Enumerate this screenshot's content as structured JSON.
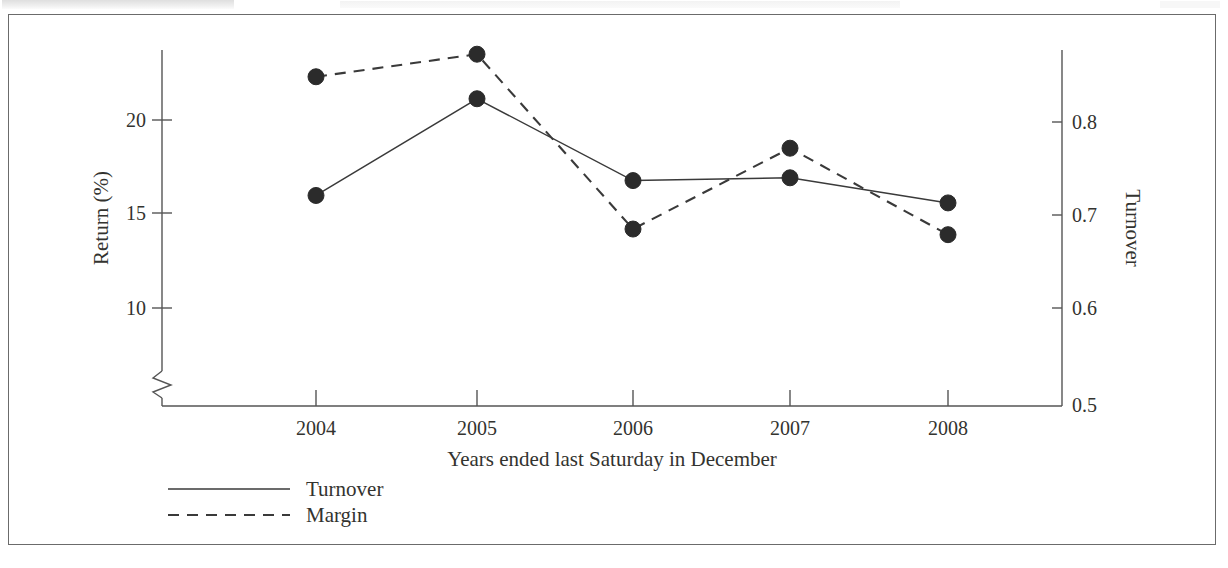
{
  "figure": {
    "background_color": "#ffffff",
    "frame_color": "#6b6b6b",
    "ink_color": "#2b2b2b"
  },
  "chart_data": {
    "type": "line",
    "title": "",
    "subtitle": "",
    "xlabel": "Years ended last Saturday in December",
    "categories": [
      "2004",
      "2005",
      "2006",
      "2007",
      "2008"
    ],
    "x": [
      2004,
      2005,
      2006,
      2007,
      2008
    ],
    "grid": false,
    "legend_position": "below-left",
    "markers": "filled-circle",
    "axes": {
      "left": {
        "label": "Return (%)",
        "ticks": [
          "10",
          "15",
          "20"
        ],
        "tick_values": [
          10,
          15,
          20
        ],
        "ylim": [
          10,
          24.5
        ],
        "axis_break": true,
        "break_note": "zigzag break below 10"
      },
      "right": {
        "label": "Turnover",
        "ticks": [
          "0.5",
          "0.6",
          "0.7",
          "0.8"
        ],
        "tick_values": [
          0.5,
          0.6,
          0.7,
          0.8
        ],
        "ylim": [
          0.5,
          0.855
        ]
      }
    },
    "series": [
      {
        "name": "Turnover",
        "axis": "right",
        "style": "solid",
        "values": [
          0.721,
          0.825,
          0.737,
          0.74,
          0.713
        ]
      },
      {
        "name": "Margin",
        "axis": "left",
        "style": "dashed",
        "values": [
          22.3,
          23.5,
          14.2,
          18.5,
          13.9
        ]
      }
    ]
  },
  "legend": {
    "items": [
      {
        "label": "Turnover",
        "style": "solid"
      },
      {
        "label": "Margin",
        "style": "dashed"
      }
    ]
  },
  "ticks": {
    "left": {
      "t0": "20",
      "t1": "15",
      "t2": "10"
    },
    "right": {
      "r0": "0.8",
      "r1": "0.7",
      "r2": "0.6",
      "r3": "0.5"
    },
    "x": {
      "x0": "2004",
      "x1": "2005",
      "x2": "2006",
      "x3": "2007",
      "x4": "2008"
    }
  },
  "labels": {
    "left_axis_title": "Return (%)",
    "right_axis_title": "Turnover",
    "x_axis_title": "Years ended last Saturday in December"
  }
}
